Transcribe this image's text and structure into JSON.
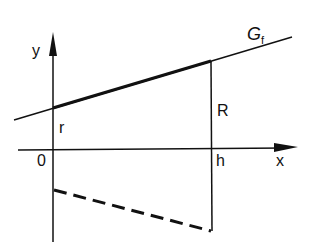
{
  "diagram": {
    "colors": {
      "ink": "#111111",
      "background": "#ffffff"
    },
    "labels": {
      "y_axis": "y",
      "x_axis": "x",
      "origin": "0",
      "r": "r",
      "R": "R",
      "h": "h",
      "graph_name": "G",
      "graph_subscript": "f"
    },
    "elements": [
      "y-axis with arrow",
      "x-axis with arrow",
      "line G_f (thin, extended)",
      "thick segment of G_f from x=0 to x=h",
      "vertical segment at x=h of length R",
      "dashed mirrored segment below x-axis"
    ]
  }
}
